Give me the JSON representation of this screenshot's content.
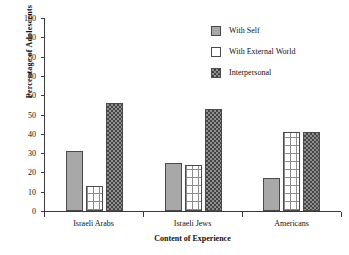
{
  "chart_data": {
    "type": "bar",
    "title": "",
    "xlabel": "Content of Experience",
    "ylabel": "Percentage of Adolescents",
    "categories": [
      "Israeli Arabs",
      "Israeli Jews",
      "Americans"
    ],
    "series": [
      {
        "name": "With Self",
        "values": [
          31,
          25,
          17
        ],
        "color": "#a8a8a8",
        "pattern": "solid-gray"
      },
      {
        "name": "With External World",
        "values": [
          13,
          24,
          41
        ],
        "color": "#ffffff",
        "pattern": "grid-on-white"
      },
      {
        "name": "Interpersonal",
        "values": [
          56,
          53,
          41
        ],
        "color": "#4f4f4f",
        "pattern": "dark-checker"
      }
    ],
    "ylim": [
      0,
      100
    ],
    "yticks": [
      0,
      10,
      20,
      30,
      40,
      50,
      60,
      70,
      80,
      90,
      100
    ],
    "ytick_labels": [
      "0",
      "10",
      "20",
      "30",
      "40",
      "50",
      "60",
      "70",
      "80",
      "90",
      "100"
    ],
    "grid": false,
    "legend_position": "top-right"
  },
  "legend": {
    "items": [
      {
        "label": "With Self",
        "swatch": "solid-gray-swatch"
      },
      {
        "label": "With External World",
        "swatch": "white-outline-swatch"
      },
      {
        "label": "Interpersonal",
        "swatch": "dark-checker-swatch"
      }
    ]
  },
  "axes": {
    "x_title": "Content of Experience",
    "y_title": "Percentage of Adolescents"
  }
}
